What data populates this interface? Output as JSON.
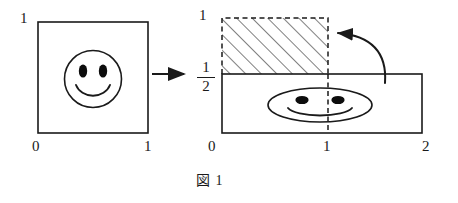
{
  "figure": {
    "caption": "図 1",
    "left_panel": {
      "name": "unit-square-with-smiley",
      "x_axis_labels": [
        "0",
        "1"
      ],
      "y_axis_labels": [
        "1"
      ],
      "domain": {
        "x": [
          0,
          1
        ],
        "y": [
          0,
          1
        ]
      },
      "face": "round-smiley-face"
    },
    "transform_arrow": {
      "name": "transform-arrow",
      "direction": "right",
      "glyph": "→"
    },
    "right_panel": {
      "name": "stretched-rectangle-with-squashed-smiley",
      "x_axis_labels": [
        "0",
        "1",
        "2"
      ],
      "y_axis_labels": [
        "1"
      ],
      "y_fraction_label": {
        "numerator": "1",
        "denominator": "2"
      },
      "domain": {
        "x": [
          0,
          2
        ],
        "y": [
          0,
          0.5
        ]
      },
      "hatched_region": {
        "name": "hatched-region",
        "x": [
          0,
          1
        ],
        "y": [
          0.5,
          1
        ],
        "border": "dashed",
        "fill": "diagonal-hatching"
      },
      "dashed_divider_x": 1,
      "face": "squashed-smiley-face"
    },
    "fold_arrow": {
      "name": "fold-arrow",
      "description": "curved arrow pointing from rectangle interior up-left into hatched region"
    },
    "colors": {
      "stroke": "#1a1a1a",
      "background": "#ffffff",
      "hatch": "#3a3a3a"
    }
  }
}
